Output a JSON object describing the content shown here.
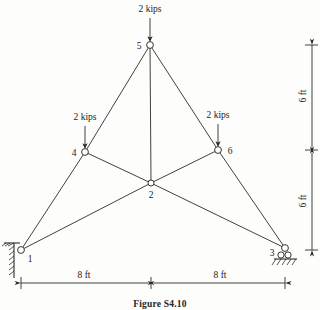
{
  "figure": {
    "caption": "Figure S4.10",
    "type": "planar-truss-free-body-diagram"
  },
  "loads": [
    {
      "id": "load-node-5",
      "label": "2 kips",
      "at_joint": "5",
      "direction": "down",
      "magnitude": 2,
      "unit": "kips"
    },
    {
      "id": "load-node-4",
      "label": "2 kips",
      "at_joint": "4",
      "direction": "down",
      "magnitude": 2,
      "unit": "kips"
    },
    {
      "id": "load-node-6",
      "label": "2 kips",
      "at_joint": "6",
      "direction": "down",
      "magnitude": 2,
      "unit": "kips"
    }
  ],
  "joints": [
    {
      "id": "1",
      "label": "1",
      "x": 21,
      "y": 250,
      "support": "pin"
    },
    {
      "id": "2",
      "label": "2",
      "x": 151,
      "y": 183,
      "support": "none"
    },
    {
      "id": "3",
      "label": "3",
      "x": 285,
      "y": 248,
      "support": "roller"
    },
    {
      "id": "4",
      "label": "4",
      "x": 85,
      "y": 152,
      "support": "none"
    },
    {
      "id": "5",
      "label": "5",
      "x": 150,
      "y": 45,
      "support": "none"
    },
    {
      "id": "6",
      "label": "6",
      "x": 218,
      "y": 150,
      "support": "none"
    }
  ],
  "members": [
    {
      "from": "1",
      "to": "4"
    },
    {
      "from": "4",
      "to": "5"
    },
    {
      "from": "4",
      "to": "2"
    },
    {
      "from": "1",
      "to": "2"
    },
    {
      "from": "5",
      "to": "2"
    },
    {
      "from": "5",
      "to": "6"
    },
    {
      "from": "2",
      "to": "6"
    },
    {
      "from": "2",
      "to": "3"
    },
    {
      "from": "6",
      "to": "3"
    }
  ],
  "dimensions": {
    "horizontal": [
      {
        "id": "dim-left-span",
        "label": "8 ft",
        "value": 8,
        "unit": "ft",
        "from_joint": "1",
        "to_joint": "2"
      },
      {
        "id": "dim-right-span",
        "label": "8 ft",
        "value": 8,
        "unit": "ft",
        "from_joint": "2",
        "to_joint": "3"
      }
    ],
    "vertical": [
      {
        "id": "dim-upper-height",
        "label": "6 ft",
        "value": 6,
        "unit": "ft",
        "from_joint": "5",
        "to_joint": "6"
      },
      {
        "id": "dim-lower-height",
        "label": "6 ft",
        "value": 6,
        "unit": "ft",
        "from_joint": "6",
        "to_joint": "3"
      }
    ]
  },
  "supports": {
    "left": {
      "id": "support-pin-node-1",
      "type": "pin",
      "at_joint": "1"
    },
    "right": {
      "id": "support-roller-node-3",
      "type": "roller",
      "at_joint": "3"
    }
  },
  "colors": {
    "line": "#2b2b2b",
    "joint_fill": "#ffffff",
    "text": "#1a1a1a",
    "background": "#fdfdfc"
  }
}
